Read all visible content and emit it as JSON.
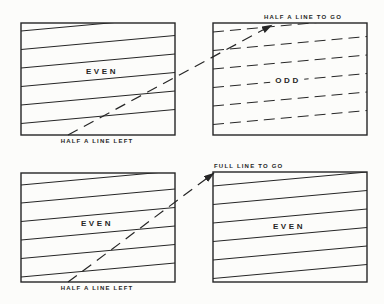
{
  "annotations": {
    "half_line_to_go": "HALF A LINE TO GO",
    "half_line_left_top": "HALF A LINE LEFT",
    "full_line_to_go": "FULL LINE TO GO",
    "half_line_left_bottom": "HALF A LINE LEFT"
  },
  "diagram": {
    "colors": {
      "line": "#262626",
      "background": "#fcfcfa"
    },
    "slope": -0.091,
    "dash_pattern_scanline": "11 6",
    "dash_pattern_retrace": "11 7",
    "boxes": [
      {
        "id": "even-field-top-left",
        "label": "EVEN",
        "x": 21,
        "y": 23,
        "w": 154,
        "h": 112,
        "style": "solid",
        "line_left_ys": [
          31,
          49.5,
          68,
          86.5,
          105,
          123.5
        ]
      },
      {
        "id": "odd-field-top-right",
        "label": "ODD",
        "x": 213,
        "y": 23,
        "w": 154,
        "h": 112,
        "style": "dashed",
        "line_left_ys": [
          32,
          50.5,
          69,
          87.5,
          106,
          124.5
        ]
      },
      {
        "id": "even-field-bottom-left",
        "label": "EVEN",
        "x": 21,
        "y": 173,
        "w": 154,
        "h": 109,
        "style": "solid",
        "line_left_ys": [
          185,
          203,
          221.5,
          240,
          258.5,
          277
        ]
      },
      {
        "id": "even-field-bottom-right",
        "label": "EVEN",
        "x": 213,
        "y": 172,
        "w": 154,
        "h": 110,
        "style": "solid",
        "line_left_ys": [
          186,
          204.5,
          223,
          241.5,
          260,
          278.5
        ]
      }
    ],
    "retraces": [
      {
        "id": "retrace-half-line",
        "from": [
          68,
          135
        ],
        "to": [
          272,
          25
        ]
      },
      {
        "id": "retrace-full-line",
        "from": [
          68,
          282
        ],
        "to": [
          214,
          173
        ]
      }
    ]
  }
}
